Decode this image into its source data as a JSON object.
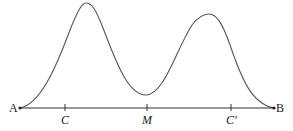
{
  "diagram": {
    "type": "bimodal-curve-over-segment",
    "colors": {
      "curve": "#555555",
      "axis": "#333333",
      "text": "#222222",
      "background": "#ffffff"
    },
    "axis": {
      "y": 108,
      "x_start": 20,
      "x_end": 274
    },
    "curve_points": {
      "start": [
        20,
        108
      ],
      "peak1": [
        85,
        3
      ],
      "valley": [
        146,
        95
      ],
      "peak2": [
        209,
        16
      ],
      "end": [
        274,
        108
      ]
    },
    "endpoints": [
      {
        "label": "A",
        "x": 20
      },
      {
        "label": "B",
        "x": 274
      }
    ],
    "ticks": [
      {
        "label": "C",
        "x": 65
      },
      {
        "label": "M",
        "x": 147
      },
      {
        "label": "C′",
        "x": 231
      }
    ]
  }
}
